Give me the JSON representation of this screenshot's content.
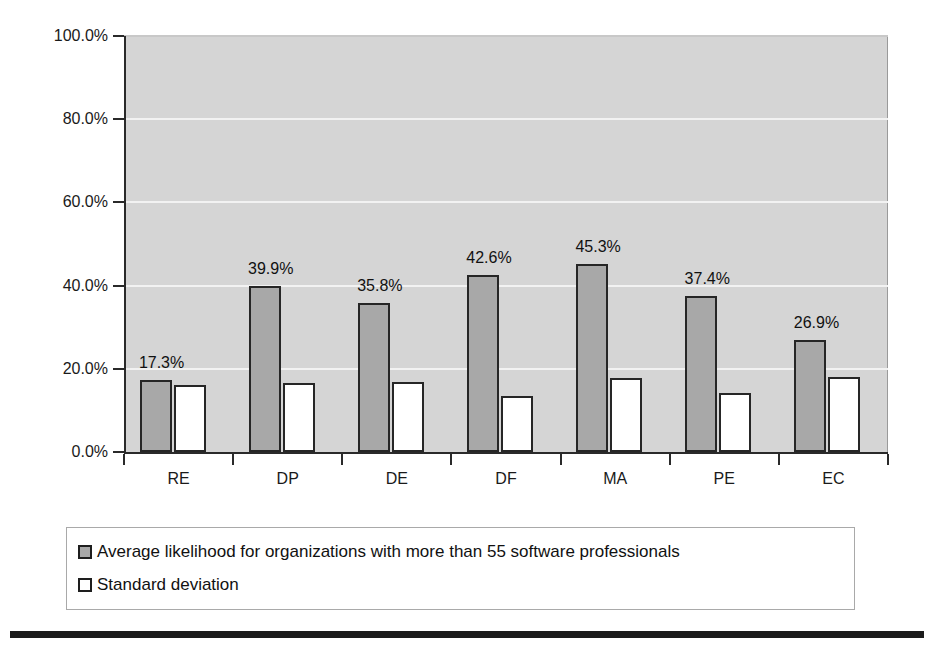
{
  "chart_data": {
    "type": "bar",
    "title": "",
    "subtitle": "",
    "xlabel": "",
    "ylabel": "",
    "categories": [
      "RE",
      "DP",
      "DE",
      "DF",
      "MA",
      "PE",
      "EC"
    ],
    "ylim": [
      0,
      100
    ],
    "y_ticks": [
      0,
      20,
      40,
      60,
      80,
      100
    ],
    "y_tick_labels": [
      "0.0%",
      "20.0%",
      "40.0%",
      "60.0%",
      "80.0%",
      "100.0%"
    ],
    "grid": true,
    "grid_axis": "y",
    "legend_position": "bottom",
    "plot_background": "#d5d5d5",
    "gridline_color": "#f2f2f2",
    "series": [
      {
        "name": "Average likelihood for organizations with more than 55 software professionals",
        "swatch": "filled",
        "color": "#a8a8a8",
        "values": [
          17.3,
          39.9,
          35.8,
          42.6,
          45.3,
          37.4,
          26.9
        ],
        "data_labels": [
          "17.3%",
          "39.9%",
          "35.8%",
          "42.6%",
          "45.3%",
          "37.4%",
          "26.9%"
        ],
        "show_data_labels": true
      },
      {
        "name": "Standard deviation",
        "swatch": "hollow",
        "color": "#ffffff",
        "values": [
          16.0,
          16.6,
          16.9,
          13.4,
          17.7,
          14.1,
          18.0
        ],
        "data_labels": [
          "",
          "",
          "",
          "",
          "",
          "",
          ""
        ],
        "show_data_labels": false
      }
    ]
  },
  "legend": {
    "items": [
      {
        "label": "Average likelihood for organizations with more than 55 software professionals",
        "swatch": "filled"
      },
      {
        "label": "Standard deviation",
        "swatch": "hollow"
      }
    ]
  }
}
